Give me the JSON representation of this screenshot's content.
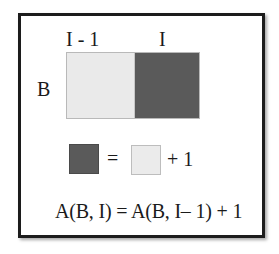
{
  "diagram": {
    "column_labels": [
      "I - 1",
      "I"
    ],
    "row_label": "B",
    "cells": [
      {
        "column": "I - 1",
        "shade": "light",
        "color": "#eaeaea"
      },
      {
        "column": "I",
        "shade": "dark",
        "color": "#5a5a5a"
      }
    ],
    "legend": {
      "left_square": "dark",
      "equals": "=",
      "right_square": "light",
      "plus_one": "+ 1"
    },
    "formula": "A(B, I) = A(B, I– 1) + 1"
  },
  "colors": {
    "light": "#eaeaea",
    "dark": "#5a5a5a",
    "frame": "#1c1c1c"
  }
}
